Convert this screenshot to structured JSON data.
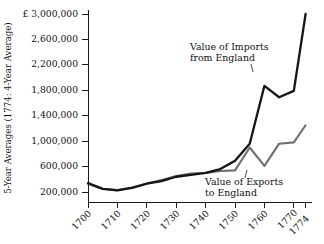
{
  "chart_data": {
    "type": "line",
    "title": "",
    "xlabel": "",
    "ylabel": "5-Year Averages (1774: 4-Year Average)",
    "currency_symbol": "£",
    "xlim": [
      1700,
      1774
    ],
    "ylim": [
      0,
      3000000
    ],
    "grid": false,
    "legend_position": "annotations-inline",
    "y_ticks": [
      200000,
      600000,
      1000000,
      1400000,
      1800000,
      2200000,
      2600000,
      3000000
    ],
    "y_tick_labels": [
      "200,000",
      "600,000",
      "1,000,000",
      "1,400,000",
      "1,800,000",
      "2,200,000",
      "2,600,000",
      "£ 3,000,000"
    ],
    "x_ticks": [
      1700,
      1710,
      1720,
      1730,
      1740,
      1750,
      1760,
      1770,
      1774
    ],
    "x_tick_labels": [
      "1700",
      "1710",
      "1720",
      "1730",
      "1740",
      "1750",
      "1760",
      "1770",
      "1774"
    ],
    "x": [
      1700,
      1705,
      1710,
      1715,
      1720,
      1725,
      1730,
      1735,
      1740,
      1745,
      1750,
      1755,
      1760,
      1765,
      1770,
      1774
    ],
    "series": [
      {
        "name": "Value of Imports from England",
        "color": "#141414",
        "values": [
          340000,
          250000,
          225000,
          265000,
          330000,
          370000,
          440000,
          470000,
          500000,
          560000,
          690000,
          960000,
          1870000,
          1690000,
          1790000,
          3000000
        ]
      },
      {
        "name": "Value of Exports to England",
        "color": "#6e6e6e",
        "values": [
          330000,
          250000,
          230000,
          270000,
          335000,
          390000,
          450000,
          490000,
          500000,
          530000,
          540000,
          900000,
          610000,
          960000,
          980000,
          1250000
        ]
      }
    ],
    "annotations": [
      {
        "id": "imports-annotation",
        "line1": "Value of Imports",
        "line2": "from England"
      },
      {
        "id": "exports-annotation",
        "line1": "Value of Exports",
        "line2": "to England"
      }
    ]
  }
}
